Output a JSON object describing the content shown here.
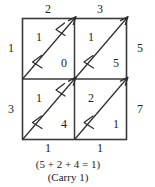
{
  "diagram": {
    "type": "lattice-multiplication-grid",
    "rows": 2,
    "cols": 2,
    "top_labels": [
      "2",
      "3"
    ],
    "left_labels": [
      "1",
      "3"
    ],
    "right_labels": [
      "5",
      "7"
    ],
    "bottom_labels": [
      "1",
      "1"
    ],
    "cells": [
      {
        "position": "top-left",
        "upper": "1",
        "lower": "0"
      },
      {
        "position": "top-right",
        "upper": "1",
        "lower": "5"
      },
      {
        "position": "bottom-left",
        "upper": "1",
        "lower": "4"
      },
      {
        "position": "bottom-right",
        "upper": "2",
        "lower": "1"
      }
    ],
    "diagonal_direction": "bottom-left-to-top-right",
    "arrow_direction": "down-left",
    "arrows_per_diagonal": 2,
    "caption": {
      "sum_line": "(5 + 2 + 4 = 1)",
      "carry_line": "(Carry 1)"
    },
    "colors": {
      "background": "#ffffff",
      "ink": "#222222",
      "border": "#3a3a3a",
      "diagonal": "#2b2b2b"
    }
  }
}
